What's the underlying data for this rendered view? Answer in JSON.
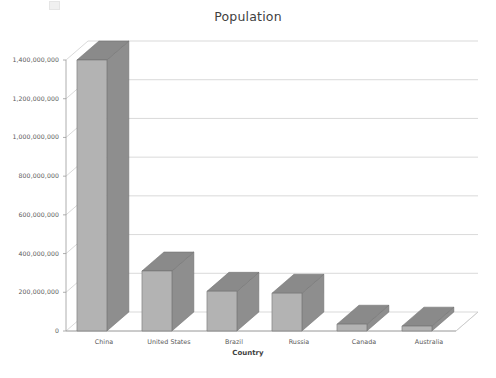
{
  "chart_data": {
    "type": "bar",
    "title": "Population",
    "xlabel": "Country",
    "ylabel": "",
    "categories": [
      "China",
      "United States",
      "Brazil",
      "Russia",
      "Canada",
      "Australia"
    ],
    "values": [
      1400000000,
      310000000,
      205000000,
      195000000,
      35000000,
      25000000
    ],
    "ylim": [
      0,
      1400000000
    ],
    "ytick_labels": [
      "0",
      "200,000,000",
      "400,000,000",
      "600,000,000",
      "800,000,000",
      "1,000,000,000",
      "1,200,000,000",
      "1,400,000,000"
    ],
    "ytick_values": [
      0,
      200000000,
      400000000,
      600000000,
      800000000,
      1000000000,
      1200000000,
      1400000000
    ],
    "grid": true,
    "legend": "none",
    "style": "3d-clustered-column",
    "colors": {
      "bar_front": "#b3b3b3",
      "bar_side": "#8e8e8e",
      "bar_top": "#8a8a8a",
      "bar_outline": "#6f6f6f",
      "gridline": "#c9c9c9",
      "axis": "#9a9a9a",
      "text": "#5a5a5a",
      "background": "#ffffff"
    }
  },
  "axes": {
    "title_text": "Population",
    "x_title_text": "Country",
    "zero_label": "0"
  }
}
